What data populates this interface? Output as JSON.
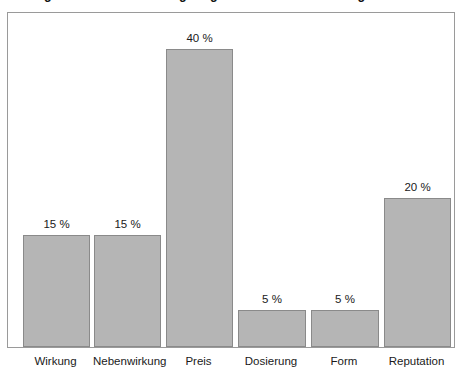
{
  "chart_data": {
    "type": "bar",
    "title": "Wichtigste Kriterien für eine geringe Medikamentenwirkung",
    "subtitle": "",
    "xlabel": "",
    "ylabel": "",
    "categories": [
      "Wirkung",
      "Nebenwirkung",
      "Preis",
      "Dosierung",
      "Form",
      "Reputation"
    ],
    "values": [
      15,
      15,
      40,
      5,
      5,
      20
    ],
    "value_labels": [
      "15 %",
      "15 %",
      "40 %",
      "5 %",
      "5 %",
      "20 %"
    ],
    "unit": "%",
    "ylim": [
      0,
      44.8
    ],
    "grid": false,
    "legend": null,
    "y_axis_visible": false,
    "y_ticks": [],
    "colors": {
      "bar_fill": "#b5b5b5",
      "bar_border": "#8a8a8a",
      "frame_border": "#9a9a9a",
      "background": "#ffffff",
      "text": "#1a1a1a"
    }
  },
  "bars": [
    {
      "label": "Wirkung",
      "value": 15,
      "value_label": "15 %"
    },
    {
      "label": "Nebenwirkung",
      "value": 15,
      "value_label": "15 %"
    },
    {
      "label": "Preis",
      "value": 40,
      "value_label": "40 %"
    },
    {
      "label": "Dosierung",
      "value": 5,
      "value_label": "5 %"
    },
    {
      "label": "Form",
      "value": 5,
      "value_label": "5 %"
    },
    {
      "label": "Reputation",
      "value": 20,
      "value_label": "20 %"
    }
  ]
}
